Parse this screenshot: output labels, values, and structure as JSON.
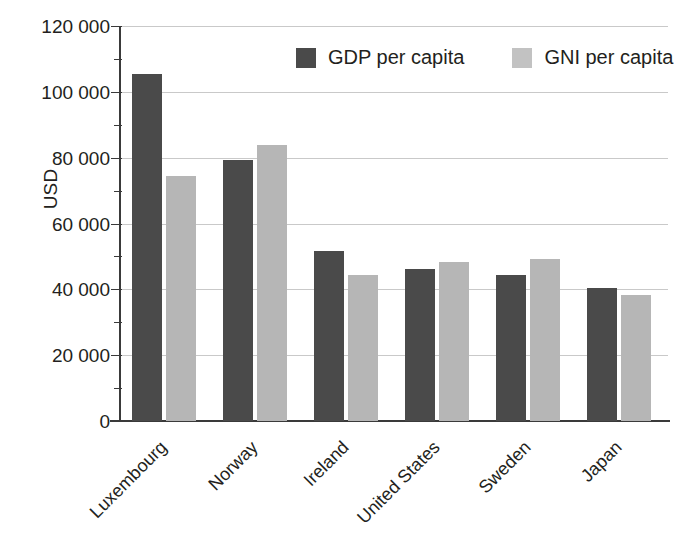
{
  "chart_data": {
    "type": "bar",
    "title": "",
    "xlabel": "",
    "ylabel": "USD",
    "ylim": [
      0,
      120000
    ],
    "ytick_step": 20000,
    "ytick_labels": [
      "120 000",
      "100 000",
      "80 000",
      "60 000",
      "40 000",
      "20 000",
      "0"
    ],
    "ytick_values": [
      120000,
      100000,
      80000,
      60000,
      40000,
      20000,
      0
    ],
    "minor_ticks": true,
    "grid": true,
    "legend_position": "top-center",
    "categories": [
      "Luxembourg",
      "Norway",
      "Ireland",
      "United States",
      "Sweden",
      "Japan"
    ],
    "series": [
      {
        "name": "GDP per capita",
        "color": "#4a4a4a",
        "values": [
          105500,
          79400,
          51500,
          46200,
          44400,
          40400
        ]
      },
      {
        "name": "GNI per capita",
        "color": "#b6b6b6",
        "values": [
          74500,
          84000,
          44300,
          48300,
          49200,
          38200
        ]
      }
    ]
  },
  "legend": {
    "items": [
      {
        "label": "GDP per capita",
        "swatch": "gdp"
      },
      {
        "label": "GNI per capita",
        "swatch": "gni"
      }
    ]
  }
}
